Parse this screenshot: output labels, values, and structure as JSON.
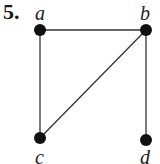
{
  "problem_number": "5.",
  "graph": {
    "vertices": [
      {
        "id": "a",
        "label": "a",
        "x": 40,
        "y": 30
      },
      {
        "id": "b",
        "label": "b",
        "x": 146,
        "y": 30
      },
      {
        "id": "c",
        "label": "c",
        "x": 40,
        "y": 138
      },
      {
        "id": "d",
        "label": "d",
        "x": 146,
        "y": 140
      }
    ],
    "edges": [
      [
        "a",
        "b"
      ],
      [
        "a",
        "c"
      ],
      [
        "b",
        "c"
      ],
      [
        "b",
        "d"
      ]
    ]
  },
  "colors": {
    "node": "#111111",
    "edge": "#333333"
  }
}
